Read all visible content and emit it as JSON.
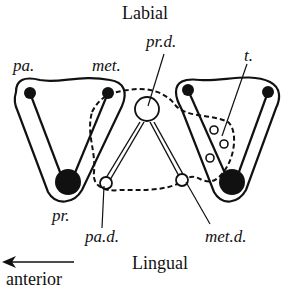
{
  "labels": {
    "top": "Labial",
    "bottom": "Lingual",
    "direction": "anterior",
    "paracone": "pa.",
    "metacone": "met.",
    "protocone": "pr.",
    "protocone_deuterocone": "pr.d.",
    "paracone_deuterocone": "pa.d.",
    "metacone_deuterocone": "met.d.",
    "talon": "t."
  },
  "colors": {
    "ink": "#111111",
    "background": "#ffffff"
  }
}
